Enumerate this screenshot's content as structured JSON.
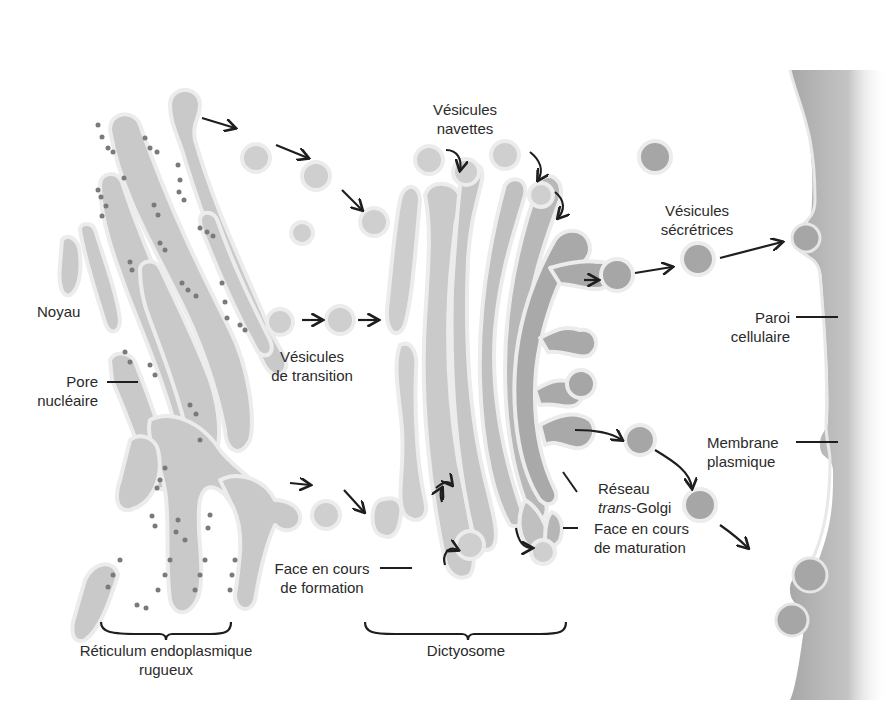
{
  "figure": {
    "title_clipped": "",
    "colors": {
      "background": "#ffffff",
      "er_fill": "#c9c9c9",
      "er_outline": "#e9e9e9",
      "ribosome": "#7a7a7a",
      "golgi_cis_fill": "#cdcdcd",
      "golgi_trans_fill": "#a9a9a9",
      "vesicle_light": "#cfcfcf",
      "vesicle_dark": "#a6a6a6",
      "cell_wall": "#b8b8b8",
      "arrow": "#1e1e1e",
      "text": "#2a2a2a"
    }
  },
  "labels": {
    "noyau": "Noyau",
    "pore_line1": "Pore",
    "pore_line2": "nucléaire",
    "vesicules_navettes_line1": "Vésicules",
    "vesicules_navettes_line2": "navettes",
    "vesicules_transition_line1": "Vésicules",
    "vesicules_transition_line2": "de transition",
    "vesicules_secretrices_line1": "Vésicules",
    "vesicules_secretrices_line2": "sécrétrices",
    "paroi_line1": "Paroi",
    "paroi_line2": "cellulaire",
    "membrane_line1": "Membrane",
    "membrane_line2": "plasmique",
    "reseau_line1": "Réseau",
    "reseau_line2_italic": "trans",
    "reseau_line2_rest": "-Golgi",
    "face_maturation_line1": "Face en cours",
    "face_maturation_line2": "de maturation",
    "face_formation_line1": "Face en cours",
    "face_formation_line2": "de formation",
    "rer_line1": "Réticulum endoplasmique",
    "rer_line2": "rugueux",
    "dictyosome": "Dictyosome"
  },
  "structures": [
    {
      "id": "rer",
      "name": "Réticulum endoplasmique rugueux"
    },
    {
      "id": "dictyosome",
      "name": "Dictyosome"
    },
    {
      "id": "cell-wall",
      "name": "Paroi cellulaire"
    },
    {
      "id": "plasma-membrane",
      "name": "Membrane plasmique"
    }
  ]
}
